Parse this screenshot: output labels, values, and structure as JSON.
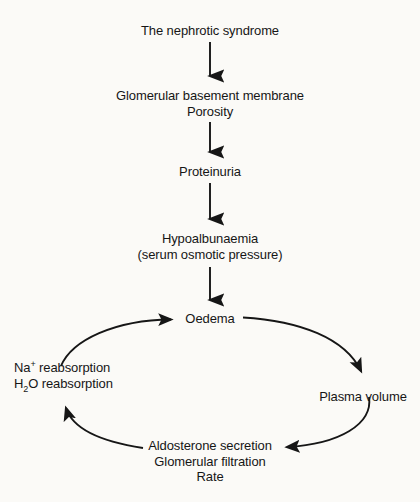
{
  "diagram": {
    "type": "flowchart",
    "title_node": "The nephrotic syndrome",
    "background_color": "#fbfaf7",
    "line_color": "#161616",
    "text_color": "#161616",
    "nodes": [
      {
        "id": "nephrotic-syndrome",
        "lines": [
          "The nephrotic syndrome"
        ],
        "align": "center"
      },
      {
        "id": "gbm-porosity",
        "lines": [
          "Glomerular basement membrane",
          "Porosity"
        ],
        "align": "center"
      },
      {
        "id": "proteinuria",
        "lines": [
          "Proteinuria"
        ],
        "align": "center"
      },
      {
        "id": "hypoalbunaemia",
        "lines": [
          "Hypoalbunaemia",
          "(serum osmotic pressure)"
        ],
        "align": "center"
      },
      {
        "id": "oedema",
        "lines": [
          "Oedema"
        ],
        "align": "center"
      },
      {
        "id": "plasma-volume",
        "lines": [
          "Plasma volume"
        ],
        "align": "center"
      },
      {
        "id": "aldosterone-gfr",
        "lines": [
          "Aldosterone secretion",
          "Glomerular filtration",
          "Rate"
        ],
        "align": "center"
      },
      {
        "id": "reabsorption",
        "lines_rich": [
          {
            "prefix": "Na",
            "sup": "+",
            "sub": "",
            "suffix": " reabsorption"
          },
          {
            "prefix": "H",
            "sup": "",
            "sub": "2",
            "suffix": "O reabsorption"
          }
        ],
        "align": "left"
      }
    ],
    "edges": [
      {
        "from": "nephrotic-syndrome",
        "to": "gbm-porosity",
        "style": "straight-down"
      },
      {
        "from": "gbm-porosity",
        "to": "proteinuria",
        "style": "straight-down"
      },
      {
        "from": "proteinuria",
        "to": "hypoalbunaemia",
        "style": "straight-down"
      },
      {
        "from": "hypoalbunaemia",
        "to": "oedema",
        "style": "straight-down"
      },
      {
        "from": "oedema",
        "to": "plasma-volume",
        "style": "curve-clockwise"
      },
      {
        "from": "plasma-volume",
        "to": "aldosterone-gfr",
        "style": "curve-clockwise"
      },
      {
        "from": "aldosterone-gfr",
        "to": "reabsorption",
        "style": "curve-clockwise"
      },
      {
        "from": "reabsorption",
        "to": "oedema",
        "style": "curve-clockwise"
      }
    ]
  }
}
